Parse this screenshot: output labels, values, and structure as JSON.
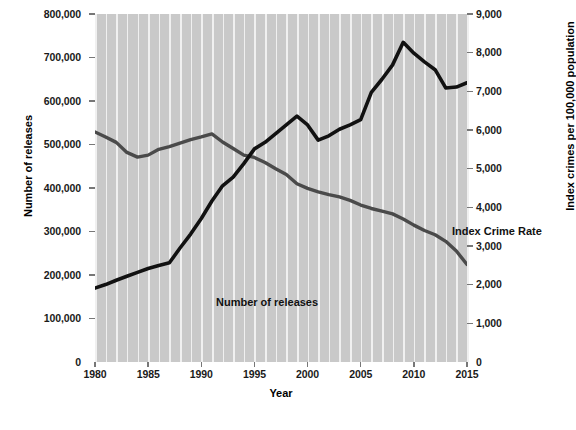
{
  "chart_data": {
    "type": "line",
    "title": "",
    "xlabel": "Year",
    "ylabel": "Number of releases",
    "ylabel_right": "Index crimes per 100,000 population",
    "grid": "vertical-white-on-gray",
    "legend_position": "inline-annotations",
    "xlim": [
      1980,
      2015
    ],
    "ylim": [
      0,
      800000
    ],
    "ylim_right": [
      0,
      9000
    ],
    "xticks": [
      "1980",
      "1985",
      "1990",
      "1995",
      "2000",
      "2005",
      "2010",
      "2015"
    ],
    "yticks_left": [
      "0",
      "100,000",
      "200,000",
      "300,000",
      "400,000",
      "500,000",
      "600,000",
      "700,000",
      "800,000"
    ],
    "yticks_right": [
      "0",
      "1,000",
      "2,000",
      "3,000",
      "4,000",
      "5,000",
      "6,000",
      "7,000",
      "8,000",
      "9,000"
    ],
    "x": [
      1980,
      1981,
      1982,
      1983,
      1984,
      1985,
      1986,
      1987,
      1988,
      1989,
      1990,
      1991,
      1992,
      1993,
      1994,
      1995,
      1996,
      1997,
      1998,
      1999,
      2000,
      2001,
      2002,
      2003,
      2004,
      2005,
      2006,
      2007,
      2008,
      2009,
      2010,
      2011,
      2012,
      2013,
      2014,
      2015
    ],
    "series": [
      {
        "name": "Number of releases",
        "axis": "left",
        "color": "#111111",
        "label_x": 1983.5,
        "label_y": 190000,
        "values": [
          170000,
          178000,
          188000,
          197000,
          206000,
          215000,
          222000,
          228000,
          262000,
          294000,
          330000,
          370000,
          405000,
          425000,
          456000,
          490000,
          505000,
          525000,
          545000,
          565000,
          545000,
          510000,
          520000,
          535000,
          545000,
          557000,
          620000,
          650000,
          683000,
          735000,
          710000,
          690000,
          672000,
          630000,
          632000,
          642000
        ]
      },
      {
        "name": "Index Crime Rate",
        "axis": "right",
        "color": "#4a4a4a",
        "label_x": 2002.5,
        "label_y": 4400,
        "values": [
          5950,
          5820,
          5680,
          5420,
          5300,
          5350,
          5500,
          5570,
          5660,
          5750,
          5820,
          5900,
          5690,
          5520,
          5350,
          5290,
          5160,
          5000,
          4850,
          4610,
          4490,
          4400,
          4330,
          4270,
          4180,
          4060,
          3970,
          3900,
          3830,
          3700,
          3540,
          3400,
          3290,
          3120,
          2870,
          2520
        ]
      }
    ]
  },
  "axes": {
    "x_title": "Year",
    "y_title_left": "Number of releases",
    "y_title_right": "Index crimes per 100,000 population"
  }
}
